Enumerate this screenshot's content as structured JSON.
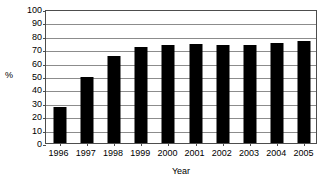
{
  "chart_data": {
    "type": "bar",
    "title": "",
    "xlabel": "Year",
    "ylabel": "%",
    "categories": [
      "1996",
      "1997",
      "1998",
      "1999",
      "2000",
      "2001",
      "2002",
      "2003",
      "2004",
      "2005"
    ],
    "values": [
      27,
      49,
      65,
      71.5,
      73.5,
      74,
      73.5,
      73.5,
      74.5,
      76
    ],
    "ylim": [
      0,
      100
    ],
    "ytick_labels": [
      "100",
      "90",
      "80",
      "70",
      "60",
      "50",
      "40",
      "30",
      "20",
      "10",
      "0"
    ],
    "ytick_values": [
      100,
      90,
      80,
      70,
      60,
      50,
      40,
      30,
      20,
      10,
      0
    ],
    "grid": true,
    "legend": "none",
    "bar_color": "#000000",
    "gridline_color": "#8c8c8c",
    "axis_color": "#4d4d4d",
    "background_color": "#ffffff"
  }
}
